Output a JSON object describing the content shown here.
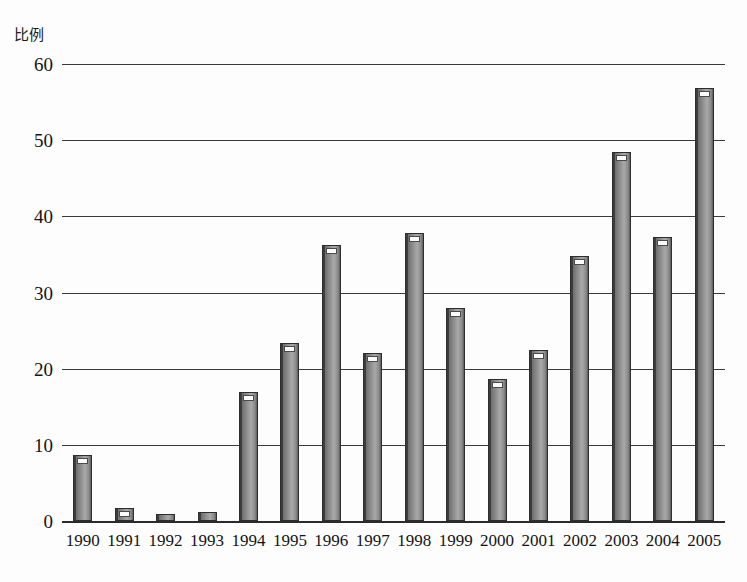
{
  "chart_data": {
    "type": "bar",
    "title": "",
    "ylabel": "比例",
    "xlabel": "",
    "ylim": [
      0,
      60
    ],
    "yticks": [
      0,
      10,
      20,
      30,
      40,
      50,
      60
    ],
    "grid": true,
    "legend": "none",
    "categories": [
      "1990",
      "1991",
      "1992",
      "1993",
      "1994",
      "1995",
      "1996",
      "1997",
      "1998",
      "1999",
      "2000",
      "2001",
      "2002",
      "2003",
      "2004",
      "2005"
    ],
    "values": [
      8.7,
      1.7,
      0.9,
      1.2,
      17.0,
      23.4,
      36.2,
      22.1,
      37.8,
      28.0,
      18.7,
      22.5,
      34.8,
      48.4,
      37.3,
      56.8
    ],
    "series": [
      {
        "name": "比例",
        "values": [
          8.7,
          1.7,
          0.9,
          1.2,
          17.0,
          23.4,
          36.2,
          22.1,
          37.8,
          28.0,
          18.7,
          22.5,
          34.8,
          48.4,
          37.3,
          56.8
        ]
      }
    ],
    "bar_color": "#8f8f8f",
    "axis_color": "#2b2b2b"
  }
}
